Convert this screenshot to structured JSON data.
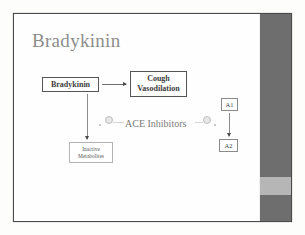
{
  "slide": {
    "title": "Bradykinin",
    "background_color": "#ffffff",
    "title_color": "#8d8d8d",
    "band_color": "#6e6e6e",
    "band_highlight_color": "#b6b6b6"
  },
  "diagram": {
    "boxes": [
      {
        "id": "bradykinin",
        "label": "Bradykinin"
      },
      {
        "id": "cough_vasodilation",
        "label": "Cough\nVasodilation",
        "line1": "Cough",
        "line2": "Vasodilation"
      },
      {
        "id": "inactive_metabolites",
        "line1": "Inactive",
        "line2": "Metabolites"
      },
      {
        "id": "a1",
        "label": "A1"
      },
      {
        "id": "a2",
        "label": "A2"
      }
    ],
    "center_label": "ACE Inhibitors",
    "arrows": [
      {
        "id": "bradykinin-to-cough",
        "direction": "right"
      },
      {
        "id": "bradykinin-to-inactive",
        "direction": "down"
      },
      {
        "id": "a1-to-a2",
        "direction": "down"
      }
    ],
    "inhibition_markers": [
      {
        "id": "inhibition-left"
      },
      {
        "id": "inhibition-right"
      }
    ]
  }
}
